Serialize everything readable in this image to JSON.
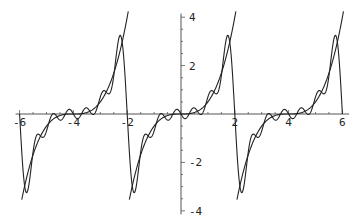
{
  "chart_data": {
    "type": "line",
    "title": "",
    "xlabel": "",
    "ylabel": "",
    "xlim": [
      -6,
      6
    ],
    "ylim": [
      -4,
      4
    ],
    "grid": false,
    "legend": null,
    "x_ticks": [
      -6,
      -4,
      -2,
      2,
      4,
      6
    ],
    "x_tick_labels": [
      "-6",
      "-4",
      "-2",
      "2",
      "4",
      "6"
    ],
    "y_ticks": [
      -4,
      -2,
      2,
      4
    ],
    "y_tick_labels": [
      "-4",
      "-2",
      "2",
      "4"
    ],
    "series": [
      {
        "name": "periodic function f(x) = x^3/2 on (-2,2), period 4",
        "style": "smooth sawtooth-like curve, jumps from about 4 to -4 at x = -2, 2, 6",
        "sample_points": [
          [
            -6,
            -4.0
          ],
          [
            -5,
            -0.5
          ],
          [
            -4,
            0.0
          ],
          [
            -3,
            0.5
          ],
          [
            -2,
            4.0
          ],
          [
            -1,
            -0.5
          ],
          [
            0,
            0.0
          ],
          [
            1,
            0.5
          ],
          [
            2,
            4.0
          ],
          [
            3,
            -0.5
          ],
          [
            4,
            0.0
          ],
          [
            5,
            0.5
          ],
          [
            6,
            4.0
          ]
        ]
      },
      {
        "name": "Fourier partial sum approximation",
        "style": "wiggly curve oscillating around f(x), overshooting near jumps (peak about 3.7 / trough about -3.7)",
        "terms": 6,
        "sample_points": [
          [
            -6,
            0.0
          ],
          [
            -5.65,
            -3.7
          ],
          [
            -4,
            0.0
          ],
          [
            -2.35,
            3.7
          ],
          [
            -2,
            0.0
          ],
          [
            -1.65,
            -3.7
          ],
          [
            0,
            0.0
          ],
          [
            1.65,
            3.7
          ],
          [
            2,
            0.0
          ],
          [
            2.35,
            -3.7
          ],
          [
            4,
            0.0
          ],
          [
            5.65,
            3.7
          ],
          [
            6,
            0.0
          ]
        ]
      }
    ],
    "colors": {
      "axis": "#555555",
      "line": "#222222",
      "background": "#ffffff"
    }
  }
}
